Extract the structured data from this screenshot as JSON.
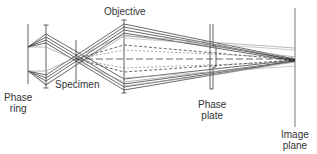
{
  "diagram": {
    "colors": {
      "line_dark": "#2a2a2a",
      "line_gray": "#9a9a9a",
      "text": "#333333",
      "background": "#ffffff"
    },
    "labels": {
      "objective": "Objective",
      "specimen": "Specimen",
      "phase_ring": {
        "line1": "Phase",
        "line2": "ring"
      },
      "phase_plate": {
        "line1": "Phase",
        "line2": "plate"
      },
      "image_plane": {
        "line1": "Image",
        "line2": "plane"
      }
    },
    "components": [
      {
        "name": "Phase ring",
        "x": 28
      },
      {
        "name": "Condenser lens",
        "x": 46
      },
      {
        "name": "Specimen",
        "x": 76
      },
      {
        "name": "Objective",
        "x": 124
      },
      {
        "name": "Phase plate",
        "x": 212
      },
      {
        "name": "Image plane",
        "x": 295
      }
    ]
  }
}
